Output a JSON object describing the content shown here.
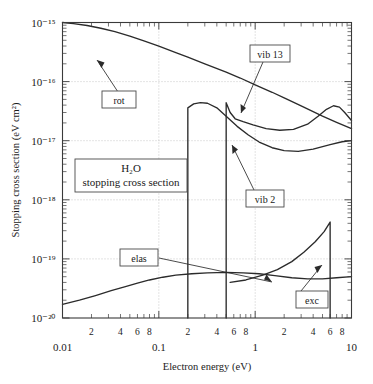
{
  "figure": {
    "title_box_line1": "H₂O",
    "title_box_line2": "stopping cross section",
    "xlabel": "Electron energy (eV)",
    "ylabel": "Stopping cross section (eV cm²)"
  },
  "axes": {
    "x_major_labels": [
      "0.01",
      "0.1",
      "1",
      "10"
    ],
    "x_minor_labels": [
      "2",
      "4",
      "6",
      "8"
    ],
    "y_major_labels": [
      "10⁻²⁰",
      "10⁻¹⁹",
      "10⁻¹⁸",
      "10⁻¹⁷",
      "10⁻¹⁶",
      "10⁻¹⁵"
    ]
  },
  "annotations": {
    "rot": "rot",
    "vib13": "vib 13",
    "vib2": "vib 2",
    "elas": "elas",
    "exc": "exc"
  },
  "chart_data": {
    "type": "line",
    "xlabel": "Electron energy (eV)",
    "ylabel": "Stopping cross section (eV cm^2)",
    "xscale": "log",
    "yscale": "log",
    "xlim": [
      0.01,
      10
    ],
    "ylim": [
      1e-20,
      1e-15
    ],
    "grid": true,
    "legend": "inline-annotations",
    "series": [
      {
        "name": "rot",
        "label": "rot",
        "points": [
          [
            0.01,
            1e-15
          ],
          [
            0.013,
            9.6e-16
          ],
          [
            0.018,
            8.9e-16
          ],
          [
            0.025,
            8e-16
          ],
          [
            0.035,
            7e-16
          ],
          [
            0.05,
            5.9e-16
          ],
          [
            0.07,
            4.9e-16
          ],
          [
            0.1,
            4e-16
          ],
          [
            0.15,
            3.1e-16
          ],
          [
            0.2,
            2.6e-16
          ],
          [
            0.3,
            2e-16
          ],
          [
            0.5,
            1.45e-16
          ],
          [
            0.7,
            1.15e-16
          ],
          [
            1.0,
            8.8e-17
          ],
          [
            1.5,
            6.6e-17
          ],
          [
            2.0,
            5.3e-17
          ],
          [
            3.0,
            3.9e-17
          ],
          [
            5.0,
            2.6e-17
          ],
          [
            7.0,
            2.05e-17
          ],
          [
            10.0,
            1.6e-17
          ]
        ]
      },
      {
        "name": "vib2",
        "label": "vib 2",
        "onset_eV": 0.2,
        "points": [
          [
            0.2,
            1e-20
          ],
          [
            0.2,
            3.6e-17
          ],
          [
            0.23,
            4.2e-17
          ],
          [
            0.27,
            4.4e-17
          ],
          [
            0.32,
            4.3e-17
          ],
          [
            0.4,
            3.6e-17
          ],
          [
            0.5,
            2.6e-17
          ],
          [
            0.65,
            1.75e-17
          ],
          [
            0.85,
            1.25e-17
          ],
          [
            1.1,
            9.5e-18
          ],
          [
            1.5,
            7.6e-18
          ],
          [
            2.0,
            6.8e-18
          ],
          [
            2.8,
            6.6e-18
          ],
          [
            4.0,
            7.2e-18
          ],
          [
            6.0,
            8.6e-18
          ],
          [
            8.0,
            9.6e-18
          ],
          [
            10.0,
            1e-17
          ]
        ]
      },
      {
        "name": "vib13",
        "label": "vib 13",
        "onset_eV": 0.5,
        "points": [
          [
            0.5,
            1e-20
          ],
          [
            0.5,
            4.4e-17
          ],
          [
            0.55,
            3e-17
          ],
          [
            0.62,
            2.35e-17
          ],
          [
            0.75,
            2.1e-17
          ],
          [
            0.95,
            1.85e-17
          ],
          [
            1.3,
            1.6e-17
          ],
          [
            1.8,
            1.5e-17
          ],
          [
            2.5,
            1.55e-17
          ],
          [
            3.5,
            1.9e-17
          ],
          [
            4.5,
            2.6e-17
          ],
          [
            5.5,
            3.4e-17
          ],
          [
            6.5,
            3.9e-17
          ],
          [
            7.5,
            3.7e-17
          ],
          [
            8.5,
            3e-17
          ],
          [
            10.0,
            2.2e-17
          ]
        ]
      },
      {
        "name": "elas",
        "label": "elas",
        "points": [
          [
            0.01,
            1.7e-20
          ],
          [
            0.015,
            2e-20
          ],
          [
            0.022,
            2.4e-20
          ],
          [
            0.032,
            2.9e-20
          ],
          [
            0.045,
            3.4e-20
          ],
          [
            0.06,
            3.9e-20
          ],
          [
            0.08,
            4.4e-20
          ],
          [
            0.11,
            4.9e-20
          ],
          [
            0.15,
            5.3e-20
          ],
          [
            0.22,
            5.6e-20
          ],
          [
            0.32,
            5.8e-20
          ],
          [
            0.5,
            5.9e-20
          ],
          [
            0.75,
            5.8e-20
          ],
          [
            1.1,
            5.6e-20
          ],
          [
            1.6,
            5.2e-20
          ],
          [
            2.4,
            4.8e-20
          ],
          [
            3.5,
            4.6e-20
          ],
          [
            5.0,
            4.6e-20
          ],
          [
            7.0,
            4.8e-20
          ],
          [
            10.0,
            5e-20
          ]
        ]
      },
      {
        "name": "exc",
        "label": "exc",
        "onset_eV": 6.0,
        "points": [
          [
            0.55,
            4e-20
          ],
          [
            0.8,
            4.4e-20
          ],
          [
            1.2,
            5.3e-20
          ],
          [
            1.7,
            6.6e-20
          ],
          [
            2.4,
            9e-20
          ],
          [
            3.2,
            1.3e-19
          ],
          [
            4.2,
            1.95e-19
          ],
          [
            5.2,
            2.9e-19
          ],
          [
            6.0,
            4.2e-19
          ],
          [
            6.0,
            1e-20
          ]
        ]
      }
    ]
  }
}
